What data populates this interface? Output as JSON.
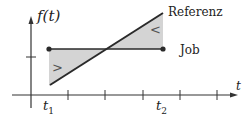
{
  "diagram": {
    "y_axis_label": "f(t)",
    "x_axis_label": "t",
    "tick_labels": {
      "t1": "t",
      "t1_sub": "1",
      "t2": "t",
      "t2_sub": "2"
    },
    "lines": {
      "reference_label": "Referenz",
      "job_label": "Job"
    },
    "region_symbols": {
      "left": ">",
      "right": "<"
    },
    "colors": {
      "line": "#2a2a2a",
      "fill": "#d4d4d4",
      "axis": "#333333"
    }
  }
}
